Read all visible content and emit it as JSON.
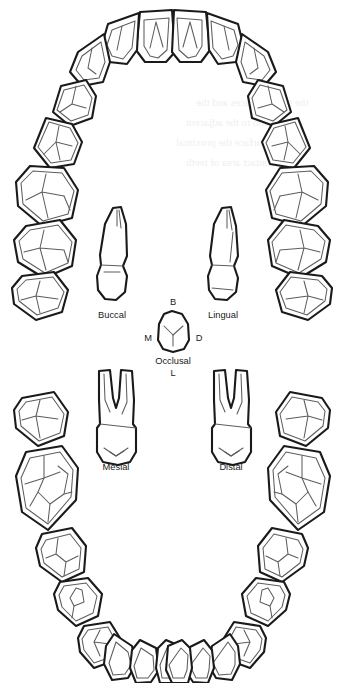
{
  "figure": {
    "background_color": "#ffffff",
    "outline_color": "#1a1a1a",
    "detail_color": "#5d5d5d"
  },
  "arches": {
    "upper": {
      "name": "Maxillary arch",
      "tooth_count": 16
    },
    "lower": {
      "name": "Mandibular arch",
      "tooth_count": 16
    }
  },
  "tooth_views": [
    {
      "id": "buccal",
      "label": "Buccal"
    },
    {
      "id": "lingual",
      "label": "Lingual"
    },
    {
      "id": "occlusal",
      "label": "Occlusal"
    },
    {
      "id": "mesial",
      "label": "Mesial"
    },
    {
      "id": "distal",
      "label": "Distal"
    }
  ],
  "orientation_markers": [
    {
      "id": "buccal-marker",
      "label": "B",
      "position": "top"
    },
    {
      "id": "mesial-marker",
      "label": "M",
      "position": "left"
    },
    {
      "id": "distal-marker",
      "label": "D",
      "position": "right"
    },
    {
      "id": "lingual-marker",
      "label": "L",
      "position": "bottom"
    }
  ]
}
